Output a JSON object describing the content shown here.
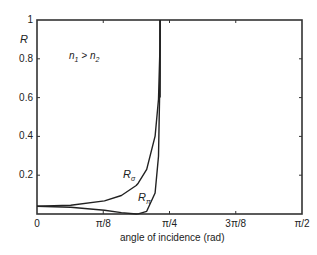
{
  "chart_data": {
    "type": "line",
    "title": "",
    "xlabel": "angle of incidence (rad)",
    "ylabel": "R",
    "annotation": "n1 > n2",
    "xlim": [
      0,
      1.5708
    ],
    "ylim": [
      0,
      1
    ],
    "grid": false,
    "legend": "inline labels",
    "x_ticks": [
      {
        "value": 0,
        "label": "0"
      },
      {
        "value": 0.3927,
        "label": "π/8"
      },
      {
        "value": 0.7854,
        "label": "π/4"
      },
      {
        "value": 1.1781,
        "label": "3π/8"
      },
      {
        "value": 1.5708,
        "label": "π/2"
      }
    ],
    "y_ticks": [
      {
        "value": 0.2,
        "label": "0.2"
      },
      {
        "value": 0.4,
        "label": "0.4"
      },
      {
        "value": 0.6,
        "label": "0.6"
      },
      {
        "value": 0.8,
        "label": "0.8"
      },
      {
        "value": 1.0,
        "label": "1"
      }
    ],
    "series": [
      {
        "name": "R_sigma",
        "label": "Rσ",
        "x": [
          0,
          0.2,
          0.4,
          0.5,
          0.588,
          0.6,
          0.65,
          0.7,
          0.72,
          0.729,
          0.7297
        ],
        "y": [
          0.04,
          0.045,
          0.0675,
          0.0955,
          0.147,
          0.159,
          0.2306,
          0.401,
          0.591,
          0.867,
          1.0
        ]
      },
      {
        "name": "R_pi",
        "label": "Rπ",
        "x": [
          0,
          0.2,
          0.4,
          0.5,
          0.588,
          0.6,
          0.65,
          0.7,
          0.72,
          0.729,
          0.7297
        ],
        "y": [
          0.04,
          0.0351,
          0.0192,
          0.0074,
          0.0,
          0.0003,
          0.0137,
          0.108,
          0.298,
          0.724,
          1.0
        ]
      }
    ],
    "critical_angle": 0.7297
  },
  "labels": {
    "ylabel": "R",
    "xlabel": "angle of incidence (rad)",
    "annotation_n1": "n",
    "annotation_n1_sub": "1",
    "annotation_gt": " > ",
    "annotation_n2": "n",
    "annotation_n2_sub": "2",
    "rs_main": "R",
    "rs_sub": "σ",
    "rp_main": "R",
    "rp_sub": "π"
  }
}
